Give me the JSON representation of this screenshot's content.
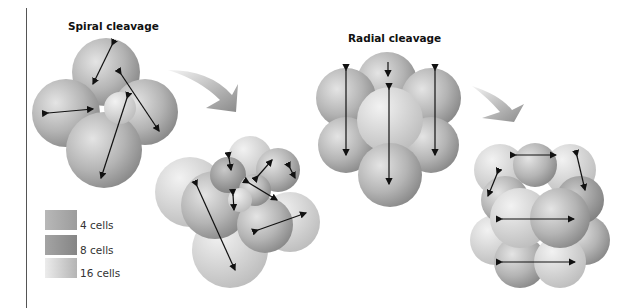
{
  "figure": {
    "panels": [
      {
        "title": "Spiral cleavage",
        "stages": [
          "4-cell (with 8-cell division arrows)",
          "8-cell to 16-cell (with division arrows)"
        ]
      },
      {
        "title": "Radial cleavage",
        "stages": [
          "4-cell (with 8-cell division arrows)",
          "8-cell to 16-cell (with division arrows)"
        ]
      }
    ],
    "legend": {
      "items": [
        {
          "label": "4 cells",
          "color": "#a6a6a6"
        },
        {
          "label": "8 cells",
          "color": "#8f8f8f"
        },
        {
          "label": "16 cells",
          "color": "#c8c8c8"
        }
      ]
    },
    "colors": {
      "cell_light": "#dcdcdc",
      "cell_mid": "#b0b0b0",
      "cell_dark": "#8c8c8c",
      "arrow": "#111111",
      "transition_arrow": "#9a9a9a"
    }
  }
}
